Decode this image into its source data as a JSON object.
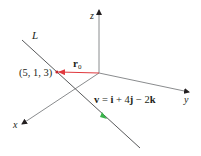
{
  "diagram": {
    "axes": {
      "x_label": "x",
      "y_label": "y",
      "z_label": "z",
      "color": "#6d6e71"
    },
    "line": {
      "label": "L",
      "color": "#58595b"
    },
    "point": {
      "label": "(5, 1, 3)",
      "color": "#c1272d"
    },
    "position_vector": {
      "label_main": "r",
      "label_sub": "0",
      "color": "#e0393e"
    },
    "direction_vector": {
      "equation": "v = i + 4j − 2k",
      "v": "v",
      "eq": " = ",
      "i": "i",
      "plus": " + 4",
      "j": "j",
      "minus": " − 2",
      "k": "k",
      "arrow_color": "#39b54a"
    }
  }
}
